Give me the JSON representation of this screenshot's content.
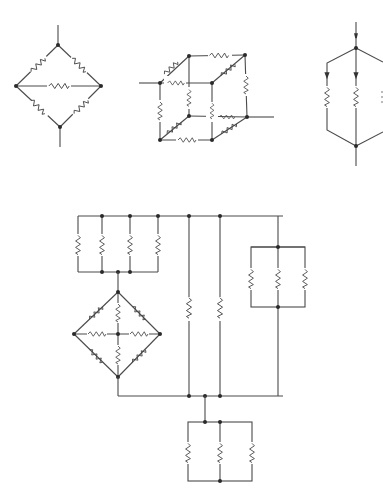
{
  "figure": {
    "caption_visible": "",
    "colors": {
      "line": "#4a4a4a",
      "node": "#2a2a2a",
      "background": "#ffffff"
    }
  },
  "diagrams": [
    {
      "id": "bridge",
      "label": "Wheatstone-bridge diamond with center resistor",
      "resistors": 5,
      "nodes": 4
    },
    {
      "id": "cube",
      "label": "Cube network of resistors",
      "resistors": 12,
      "nodes": 8
    },
    {
      "id": "parallel-hexagon",
      "label": "Parallel branches with current arrows (partially cropped)",
      "resistors": 3,
      "nodes": 2
    },
    {
      "id": "compound",
      "label": "Compound network: 4-parallel bank, 8-resistor diamond, 2 parallel branches, 3-parallel side bank, 3-parallel bottom bank",
      "resistors": 22
    }
  ]
}
